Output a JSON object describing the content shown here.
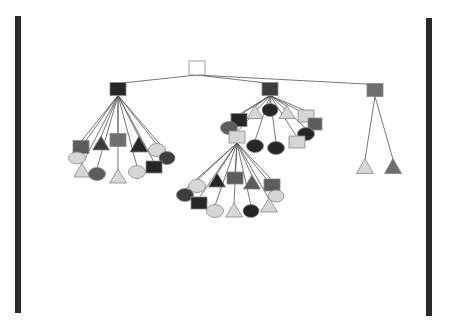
{
  "diagram": {
    "type": "tree",
    "colors": {
      "black": "#262626",
      "dark": "#3d3d3d",
      "darkgray": "#5c5c5c",
      "midgray": "#6e6e6e",
      "light": "#d6d6d6",
      "white": "#ffffff",
      "edge": "#555555"
    },
    "bars": [
      {
        "id": "left-bar",
        "x": 15,
        "y": 16,
        "w": 6,
        "h": 297
      },
      {
        "id": "right-bar",
        "x": 426,
        "y": 18,
        "w": 6,
        "h": 298
      }
    ],
    "nodes": [
      {
        "id": "root",
        "shape": "square",
        "x": 197,
        "y": 68,
        "w": 16,
        "h": 14,
        "color": "white",
        "parent": null
      },
      {
        "id": "A",
        "shape": "square",
        "x": 118,
        "y": 89,
        "w": 16,
        "h": 13,
        "color": "black",
        "parent": "root"
      },
      {
        "id": "B",
        "shape": "square",
        "x": 270,
        "y": 89,
        "w": 16,
        "h": 13,
        "color": "dark",
        "parent": "root"
      },
      {
        "id": "C",
        "shape": "square",
        "x": 375,
        "y": 90,
        "w": 16,
        "h": 13,
        "color": "midgray",
        "parent": "root"
      },
      {
        "id": "A1",
        "shape": "square",
        "x": 81,
        "y": 147,
        "w": 16,
        "h": 13,
        "color": "darkgray",
        "parent": "A"
      },
      {
        "id": "A2",
        "shape": "triangle",
        "x": 101,
        "y": 143,
        "w": 17,
        "h": 14,
        "color": "dark",
        "parent": "A"
      },
      {
        "id": "A3",
        "shape": "square",
        "x": 118,
        "y": 140,
        "w": 16,
        "h": 13,
        "color": "midgray",
        "parent": "A"
      },
      {
        "id": "A4",
        "shape": "triangle",
        "x": 139,
        "y": 144,
        "w": 18,
        "h": 16,
        "color": "black",
        "parent": "A"
      },
      {
        "id": "A5",
        "shape": "ellipse",
        "x": 157,
        "y": 150,
        "w": 17,
        "h": 13,
        "color": "light",
        "parent": "A"
      },
      {
        "id": "A6",
        "shape": "ellipse",
        "x": 167,
        "y": 158,
        "w": 16,
        "h": 13,
        "color": "dark",
        "parent": "A"
      },
      {
        "id": "A7",
        "shape": "ellipse",
        "x": 77,
        "y": 158,
        "w": 17,
        "h": 12,
        "color": "light",
        "parent": "A"
      },
      {
        "id": "A8",
        "shape": "triangle",
        "x": 82,
        "y": 170,
        "w": 16,
        "h": 14,
        "color": "light",
        "parent": "A"
      },
      {
        "id": "A9",
        "shape": "ellipse",
        "x": 97,
        "y": 174,
        "w": 17,
        "h": 13,
        "color": "darkgray",
        "parent": "A"
      },
      {
        "id": "A10",
        "shape": "triangle",
        "x": 118,
        "y": 176,
        "w": 17,
        "h": 14,
        "color": "light",
        "parent": "A"
      },
      {
        "id": "A11",
        "shape": "ellipse",
        "x": 137,
        "y": 172,
        "w": 17,
        "h": 13,
        "color": "light",
        "parent": "A"
      },
      {
        "id": "A12",
        "shape": "square",
        "x": 154,
        "y": 167,
        "w": 16,
        "h": 12,
        "color": "black",
        "parent": "A"
      },
      {
        "id": "B1",
        "shape": "triangle",
        "x": 255,
        "y": 112,
        "w": 16,
        "h": 13,
        "color": "light",
        "parent": "B"
      },
      {
        "id": "B2",
        "shape": "ellipse",
        "x": 270,
        "y": 110,
        "w": 16,
        "h": 13,
        "color": "black",
        "parent": "B"
      },
      {
        "id": "B3",
        "shape": "triangle",
        "x": 287,
        "y": 112,
        "w": 16,
        "h": 13,
        "color": "light",
        "parent": "B"
      },
      {
        "id": "B4",
        "shape": "square",
        "x": 306,
        "y": 116,
        "w": 16,
        "h": 12,
        "color": "light",
        "parent": "B"
      },
      {
        "id": "B5",
        "shape": "square",
        "x": 315,
        "y": 124,
        "w": 14,
        "h": 12,
        "color": "darkgray",
        "parent": "B"
      },
      {
        "id": "B6",
        "shape": "square",
        "x": 239,
        "y": 120,
        "w": 16,
        "h": 13,
        "color": "black",
        "parent": "B"
      },
      {
        "id": "B7",
        "shape": "ellipse",
        "x": 229,
        "y": 128,
        "w": 17,
        "h": 13,
        "color": "darkgray",
        "parent": "B"
      },
      {
        "id": "D",
        "shape": "square",
        "x": 237,
        "y": 137,
        "w": 16,
        "h": 12,
        "color": "light",
        "parent": "B"
      },
      {
        "id": "B9",
        "shape": "ellipse",
        "x": 255,
        "y": 146,
        "w": 17,
        "h": 13,
        "color": "black",
        "parent": "B"
      },
      {
        "id": "B10",
        "shape": "ellipse",
        "x": 276,
        "y": 148,
        "w": 17,
        "h": 13,
        "color": "black",
        "parent": "B"
      },
      {
        "id": "B11",
        "shape": "ellipse",
        "x": 306,
        "y": 134,
        "w": 17,
        "h": 13,
        "color": "black",
        "parent": "B"
      },
      {
        "id": "B12",
        "shape": "square",
        "x": 297,
        "y": 142,
        "w": 16,
        "h": 12,
        "color": "light",
        "parent": "B"
      },
      {
        "id": "D1",
        "shape": "ellipse",
        "x": 197,
        "y": 186,
        "w": 17,
        "h": 13,
        "color": "light",
        "parent": "D"
      },
      {
        "id": "D2",
        "shape": "ellipse",
        "x": 185,
        "y": 195,
        "w": 17,
        "h": 13,
        "color": "dark",
        "parent": "D"
      },
      {
        "id": "D3",
        "shape": "square",
        "x": 199,
        "y": 203,
        "w": 16,
        "h": 12,
        "color": "black",
        "parent": "D"
      },
      {
        "id": "D4",
        "shape": "triangle",
        "x": 217,
        "y": 180,
        "w": 17,
        "h": 14,
        "color": "black",
        "parent": "D"
      },
      {
        "id": "D5",
        "shape": "square",
        "x": 235,
        "y": 178,
        "w": 16,
        "h": 12,
        "color": "darkgray",
        "parent": "D"
      },
      {
        "id": "D6",
        "shape": "triangle",
        "x": 252,
        "y": 182,
        "w": 17,
        "h": 14,
        "color": "darkgray",
        "parent": "D"
      },
      {
        "id": "D7",
        "shape": "square",
        "x": 272,
        "y": 185,
        "w": 16,
        "h": 12,
        "color": "darkgray",
        "parent": "D"
      },
      {
        "id": "D8",
        "shape": "ellipse",
        "x": 276,
        "y": 196,
        "w": 16,
        "h": 12,
        "color": "light",
        "parent": "D"
      },
      {
        "id": "D9",
        "shape": "triangle",
        "x": 269,
        "y": 205,
        "w": 17,
        "h": 14,
        "color": "light",
        "parent": "D"
      },
      {
        "id": "D10",
        "shape": "ellipse",
        "x": 215,
        "y": 211,
        "w": 17,
        "h": 13,
        "color": "light",
        "parent": "D"
      },
      {
        "id": "D11",
        "shape": "triangle",
        "x": 234,
        "y": 210,
        "w": 17,
        "h": 14,
        "color": "light",
        "parent": "D"
      },
      {
        "id": "D12",
        "shape": "ellipse",
        "x": 251,
        "y": 211,
        "w": 16,
        "h": 13,
        "color": "black",
        "parent": "D"
      },
      {
        "id": "C1",
        "shape": "triangle",
        "x": 365,
        "y": 166,
        "w": 17,
        "h": 15,
        "color": "light",
        "parent": "C"
      },
      {
        "id": "C2",
        "shape": "triangle",
        "x": 393,
        "y": 166,
        "w": 17,
        "h": 15,
        "color": "midgray",
        "parent": "C"
      }
    ]
  }
}
